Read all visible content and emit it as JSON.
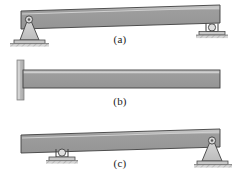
{
  "figure": {
    "background_color": "#ffffff",
    "beam_fill_top": "#b9b9b9",
    "beam_fill_body": "#9a9a9a",
    "beam_stroke": "#3c3c3c",
    "support_fill": "#c9c9c9",
    "support_stroke": "#404040",
    "ground_fill": "#d2d2d2",
    "wall_fill": "#bdbdbd",
    "caption_color": "#1a1a1a"
  },
  "diagrams": [
    {
      "id": "a",
      "caption": "(a)",
      "description": "simply supported beam",
      "beam": {
        "x": 20,
        "y": 6,
        "width": 200,
        "height": 18
      },
      "supports": [
        {
          "type": "pin-support",
          "name": "pin-support-left",
          "x": 28,
          "y": 24
        },
        {
          "type": "roller-support",
          "name": "roller-support-right",
          "x": 212,
          "y": 24
        }
      ]
    },
    {
      "id": "b",
      "caption": "(b)",
      "description": "cantilever beam fixed at wall",
      "beam": {
        "x": 22,
        "y": 68,
        "width": 198,
        "height": 18
      },
      "supports": [
        {
          "type": "fixed-wall-support",
          "name": "fixed-wall-support-left",
          "x": 16,
          "y": 60
        }
      ]
    },
    {
      "id": "c",
      "caption": "(c)",
      "description": "beam with interior roller and end pin",
      "beam": {
        "x": 20,
        "y": 130,
        "width": 200,
        "height": 18
      },
      "supports": [
        {
          "type": "roller-support",
          "name": "roller-support-interior",
          "x": 62,
          "y": 148
        },
        {
          "type": "pin-support",
          "name": "pin-support-right",
          "x": 212,
          "y": 148
        }
      ]
    }
  ],
  "captions": {
    "a": "(a)",
    "b": "(b)",
    "c": "(c)"
  }
}
